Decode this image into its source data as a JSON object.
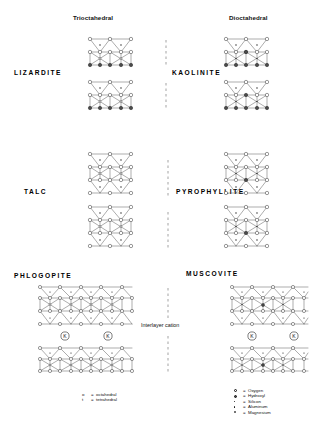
{
  "figure": {
    "title_columns": [
      {
        "id": "trioctahedral",
        "label": "Trioctahedral",
        "x": 73,
        "y": 14
      },
      {
        "id": "dioctahedral",
        "label": "Dioctahedral",
        "x": 229,
        "y": 14
      }
    ],
    "interlayer_label": "Interlayer cation",
    "interlayer_cation_symbol": "K"
  },
  "minerals": [
    {
      "id": "lizardite",
      "name": "LIZARDITE",
      "label_x": 14,
      "label_y": 69,
      "column": "trioctahedral",
      "layer_type": "1:1",
      "row": 1
    },
    {
      "id": "kaolinite",
      "name": "KAOLINITE",
      "label_x": 172,
      "label_y": 69,
      "column": "dioctahedral",
      "layer_type": "1:1",
      "row": 1
    },
    {
      "id": "talc",
      "name": "TALC",
      "label_x": 24,
      "label_y": 188,
      "column": "trioctahedral",
      "layer_type": "2:1",
      "row": 2
    },
    {
      "id": "pyrophyllite",
      "name": "PYROPHYLLITE",
      "label_x": 176,
      "label_y": 188,
      "column": "dioctahedral",
      "layer_type": "2:1",
      "row": 2
    },
    {
      "id": "phlogopite",
      "name": "PHLOGOPITE",
      "label_x": 14,
      "label_y": 272,
      "column": "trioctahedral",
      "layer_type": "2:1 mica",
      "row": 3
    },
    {
      "id": "muscovite",
      "name": "MUSCOVITE",
      "label_x": 186,
      "label_y": 270,
      "column": "dioctahedral",
      "layer_type": "2:1 mica",
      "row": 3
    }
  ],
  "legend_sheets": {
    "x": 82,
    "y": 392,
    "rows": [
      {
        "symbol": "o",
        "eq": "=",
        "text": "octahedral"
      },
      {
        "symbol": "t",
        "eq": "=",
        "text": "tetrahedral"
      }
    ]
  },
  "legend_atoms": {
    "x": 234,
    "y": 388,
    "rows": [
      {
        "symbol": "open-circle",
        "eq": "=",
        "text": "Oxygen",
        "fill": "#ffffff",
        "stroke": "#111111",
        "size": 3.2
      },
      {
        "symbol": "hatched-circle",
        "eq": "=",
        "text": "Hydroxyl",
        "fill": "#555555",
        "stroke": "#111111",
        "size": 3.2
      },
      {
        "symbol": "small-dot",
        "eq": "=",
        "text": "Silicon",
        "fill": "#111111",
        "stroke": "#111111",
        "size": 1.4
      },
      {
        "symbol": "tiny-dot",
        "eq": "=",
        "text": "Aluminum",
        "fill": "#111111",
        "stroke": "#111111",
        "size": 1.1
      },
      {
        "symbol": "open-tiny",
        "eq": "=",
        "text": "Magnesium",
        "fill": "#ffffff",
        "stroke": "#111111",
        "size": 1.6
      }
    ]
  },
  "colors": {
    "ink": "#111111",
    "paper": "#ffffff",
    "oxygen_fill": "#ffffff",
    "hydroxyl_fill": "#4a4a4a",
    "line": "#333333"
  },
  "structures": [
    {
      "id": "lizardite-upper",
      "mineral": "lizardite",
      "x": 86,
      "y": 36,
      "type": "TO",
      "cation": "Mg"
    },
    {
      "id": "lizardite-lower",
      "mineral": "lizardite",
      "x": 86,
      "y": 80,
      "type": "TO",
      "cation": "Mg"
    },
    {
      "id": "kaolinite-upper",
      "mineral": "kaolinite",
      "x": 242,
      "y": 36,
      "type": "TO",
      "cation": "Al"
    },
    {
      "id": "kaolinite-lower",
      "mineral": "kaolinite",
      "x": 242,
      "y": 80,
      "type": "TO",
      "cation": "Al"
    },
    {
      "id": "talc-upper",
      "mineral": "talc",
      "x": 86,
      "y": 152,
      "type": "TOT",
      "cation": "Mg"
    },
    {
      "id": "talc-lower",
      "mineral": "talc",
      "x": 86,
      "y": 205,
      "type": "TOT",
      "cation": "Mg"
    },
    {
      "id": "pyrophyllite-upper",
      "mineral": "pyrophyllite",
      "x": 242,
      "y": 152,
      "type": "TOT",
      "cation": "Al"
    },
    {
      "id": "pyrophyllite-lower",
      "mineral": "pyrophyllite",
      "x": 242,
      "y": 205,
      "type": "TOT",
      "cation": "Al"
    },
    {
      "id": "phlogopite-main",
      "mineral": "phlogopite",
      "x": 38,
      "y": 284,
      "type": "TOT-wide",
      "cation": "Mg"
    },
    {
      "id": "muscovite-main",
      "mineral": "muscovite",
      "x": 230,
      "y": 282,
      "type": "TOT-wide",
      "cation": "Al"
    }
  ]
}
